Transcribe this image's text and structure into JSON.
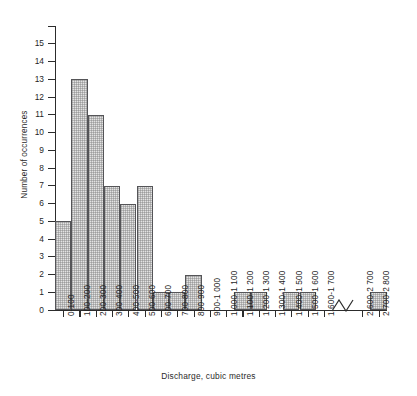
{
  "chart_data": {
    "type": "bar",
    "title": "",
    "xlabel": "Discharge, cubic metres",
    "ylabel": "Number of occurrences",
    "ylim": [
      0,
      16
    ],
    "ytick_labels": [
      "0",
      "1",
      "2",
      "3",
      "4",
      "5",
      "6",
      "7",
      "8",
      "9",
      "10",
      "11",
      "12",
      "13",
      "14",
      "15"
    ],
    "grid": false,
    "legend": null,
    "axis_break": {
      "present": true,
      "between": [
        "1 600-1 700",
        "2 600-2 700"
      ],
      "symbol": "zigzag"
    },
    "categories": [
      "0-100",
      "100-200",
      "200-300",
      "300-400",
      "400-500",
      "500-600",
      "600-700",
      "700-800",
      "800-900",
      "900-1 000",
      "1 000-1 100",
      "1 100-1 200",
      "1 200-1 300",
      "1 300-1 400",
      "1 400-1 500",
      "1 500-1 600",
      "1 600-1 700",
      "2 600-2 700",
      "2 700-2 800"
    ],
    "values": [
      5,
      13,
      11,
      7,
      6,
      7,
      1,
      1,
      2,
      0,
      0,
      1,
      1,
      0,
      1,
      1,
      0,
      0,
      1
    ]
  },
  "style": {
    "bar_fill": "#e3e3e3",
    "bar_border": "#555558",
    "axis_color": "#2c2c2c",
    "text_color": "#1f1f1f",
    "background": "#ffffff"
  }
}
